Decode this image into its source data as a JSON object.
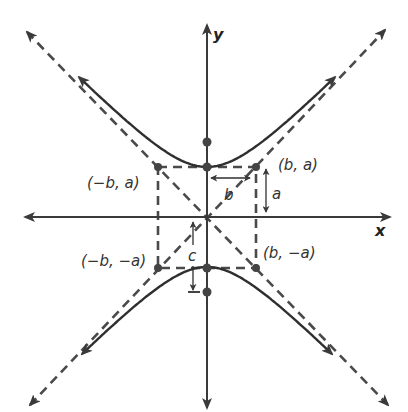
{
  "diagram": {
    "type": "hyperbola-vertical-transverse-axis",
    "origin": [
      207,
      217
    ],
    "a_px": 50,
    "b_px": 49,
    "c_px": 75,
    "colors": {
      "line": "#2f2f2f",
      "dashed": "#4a4a4a",
      "point": "#444444",
      "text": "#333333"
    },
    "axes": {
      "x_label": "x",
      "y_label": "y",
      "x_range_px": [
        25,
        390
      ],
      "y_range_px": [
        25,
        408
      ]
    },
    "points": [
      {
        "name": "vertex-upper",
        "xy": [
          207,
          167
        ]
      },
      {
        "name": "vertex-lower",
        "xy": [
          207,
          268
        ]
      },
      {
        "name": "focus-upper",
        "xy": [
          207,
          142
        ]
      },
      {
        "name": "focus-lower",
        "xy": [
          207,
          292
        ]
      },
      {
        "name": "corner-b-a",
        "xy": [
          256,
          167
        ],
        "label": "(b, a)"
      },
      {
        "name": "corner-neg-b-a",
        "xy": [
          158,
          167
        ],
        "label": "(−b, a)"
      },
      {
        "name": "corner-neg-b-neg-a",
        "xy": [
          158,
          268
        ],
        "label": "(−b, −a)"
      },
      {
        "name": "corner-b-neg-a",
        "xy": [
          256,
          268
        ],
        "label": "(b, −a)"
      }
    ],
    "labels": {
      "b_a": "(b, a)",
      "neg_b_a": "(−b, a)",
      "neg_b_neg_a": "(−b, −a)",
      "b_neg_a": "(b, −a)",
      "a": "a",
      "b": "b",
      "c": "c"
    },
    "asymptotes": [
      {
        "name": "asymptote-positive-slope",
        "from": [
          30,
          405
        ],
        "to": [
          385,
          30
        ]
      },
      {
        "name": "asymptote-negative-slope",
        "from": [
          27,
          32
        ],
        "to": [
          388,
          405
        ]
      }
    ],
    "branches": [
      "upper",
      "lower"
    ]
  }
}
